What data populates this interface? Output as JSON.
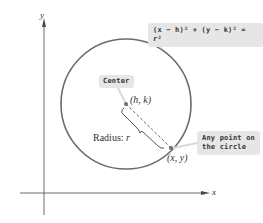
{
  "diagram": {
    "type": "circle-standard-form",
    "axes": {
      "x_label": "x",
      "y_label": "y"
    },
    "equation": "(x − h)² + (y − k)² = r²",
    "center_callout": "Center",
    "center_point_label": "(h, k)",
    "radius_label_prefix": "Radius: ",
    "radius_label_var": "r",
    "point_callout_line1": "Any point on",
    "point_callout_line2": "the circle",
    "point_label": "(x, y)",
    "colors": {
      "circle": "#6b6b6b",
      "axis": "#6b6b6b",
      "callout_bg": "#e6e6e6",
      "text": "#333333",
      "point": "#7a6a66"
    }
  }
}
